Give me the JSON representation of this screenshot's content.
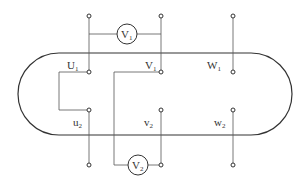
{
  "diagram": {
    "terminals_top": [
      "U1",
      "V1",
      "W1"
    ],
    "terminals_bottom": [
      "u2",
      "v2",
      "w2"
    ],
    "labels": {
      "U1": {
        "main": "U",
        "sub": "1"
      },
      "V1": {
        "main": "V",
        "sub": "1"
      },
      "W1": {
        "main": "W",
        "sub": "1"
      },
      "u2": {
        "main": "u",
        "sub": "2"
      },
      "v2": {
        "main": "v",
        "sub": "2"
      },
      "w2": {
        "main": "w",
        "sub": "2"
      }
    },
    "meters": {
      "V1": {
        "main": "V",
        "sub": "1",
        "connects": [
          "U1",
          "V1"
        ]
      },
      "V2": {
        "main": "V",
        "sub": "2",
        "connects": [
          "V1",
          "v2"
        ]
      }
    },
    "jumpers": [
      {
        "from": "U1",
        "to": "u2"
      }
    ]
  }
}
